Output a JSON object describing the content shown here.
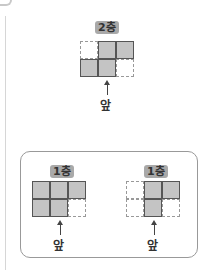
{
  "top_view": {
    "label": "2층",
    "grid": [
      [
        0,
        1,
        1
      ],
      [
        1,
        1,
        0
      ]
    ],
    "front_label": "앞"
  },
  "options_box": {
    "left": {
      "label": "1층",
      "grid": [
        [
          1,
          1,
          1
        ],
        [
          1,
          1,
          0
        ]
      ],
      "front_label": "앞"
    },
    "right": {
      "label": "1층",
      "grid": [
        [
          0,
          1,
          1
        ],
        [
          0,
          1,
          0
        ]
      ],
      "front_label": "앞"
    }
  },
  "colors": {
    "filled": "#c4c4c4",
    "label_bg": "#a9a9a9",
    "border": "#555555"
  }
}
